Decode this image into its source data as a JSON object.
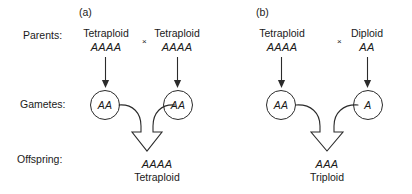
{
  "figure": {
    "panels": [
      {
        "letter": "(a)",
        "parents": [
          {
            "ploidy": "Tetraploid",
            "genotype": "AAAA"
          },
          {
            "ploidy": "Tetraploid",
            "genotype": "AAAA"
          }
        ],
        "cross_symbol": "×",
        "gametes": [
          {
            "genotype": "AA"
          },
          {
            "genotype": "AA"
          }
        ],
        "offspring": {
          "genotype": "AAAA",
          "ploidy": "Tetraploid"
        }
      },
      {
        "letter": "(b)",
        "parents": [
          {
            "ploidy": "Tetraploid",
            "genotype": "AAAA"
          },
          {
            "ploidy": "Diploid",
            "genotype": "AA"
          }
        ],
        "cross_symbol": "×",
        "gametes": [
          {
            "genotype": "AA"
          },
          {
            "genotype": "A"
          }
        ],
        "offspring": {
          "genotype": "AAA",
          "ploidy": "Triploid"
        }
      }
    ],
    "row_labels": {
      "parents": "Parents:",
      "gametes": "Gametes:",
      "offspring": "Offspring:"
    },
    "colors": {
      "ink": "#1a1a1a",
      "stroke": "#2b2b2b",
      "background": "#ffffff"
    }
  }
}
